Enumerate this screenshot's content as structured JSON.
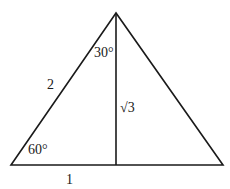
{
  "diagram": {
    "type": "triangle-with-altitude",
    "labels": {
      "top_angle": "30°",
      "hypotenuse": "2",
      "altitude": "√3",
      "bottom_angle": "60°",
      "half_base": "1"
    },
    "colors": {
      "line": "#1a1a1a",
      "background": "#ffffff"
    }
  }
}
